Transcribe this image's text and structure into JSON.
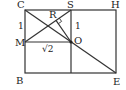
{
  "diagram": {
    "type": "geometry-figure",
    "points": {
      "C": {
        "label": "C",
        "x": 25,
        "y": 10
      },
      "S": {
        "label": "S",
        "x": 71,
        "y": 10
      },
      "H": {
        "label": "H",
        "x": 116,
        "y": 10
      },
      "M": {
        "label": "M",
        "x": 25,
        "y": 42
      },
      "O": {
        "label": "O",
        "x": 71,
        "y": 42
      },
      "B": {
        "label": "B",
        "x": 25,
        "y": 73
      },
      "E": {
        "label": "E",
        "x": 116,
        "y": 73
      },
      "R": {
        "label": "R",
        "x": 56,
        "y": 20
      }
    },
    "segment_labels": {
      "CM": "1",
      "SO": "1",
      "MO": "√2"
    },
    "colors": {
      "line": "#333333",
      "text": "#222222",
      "background": "#ffffff"
    }
  }
}
